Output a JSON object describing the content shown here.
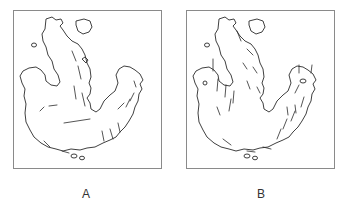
{
  "figure": {
    "panels": [
      {
        "id": "A",
        "label": "A",
        "content": "landmass outline map with sparse flow vectors"
      },
      {
        "id": "B",
        "label": "B",
        "content": "landmass outline map with denser flow vectors"
      }
    ]
  },
  "colors": {
    "line": "#2a2a2a",
    "frame": "#8a8a8a",
    "background": "#ffffff"
  }
}
